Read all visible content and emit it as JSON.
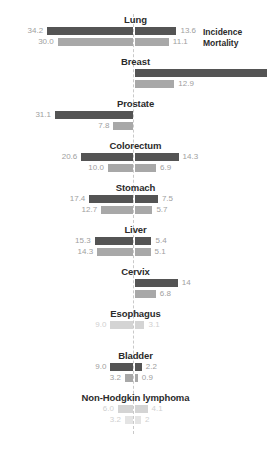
{
  "legend": {
    "incidence_label": "Incidence",
    "mortality_label": "Mortality",
    "incidence_color": "#545454",
    "mortality_color": "#a8a8a8"
  },
  "axis": {
    "center_x": 133,
    "style": "dashed",
    "color": "#c9c9c9"
  },
  "chart_data": {
    "type": "bar",
    "subtype": "diverging-bidirectional-bar",
    "title": "",
    "xlabel": "",
    "ylabel": "",
    "grid": false,
    "legend_position": "top-right",
    "series": [
      {
        "name": "Incidence",
        "color": "#545454"
      },
      {
        "name": "Mortality",
        "color": "#a8a8a8"
      }
    ],
    "categories": [
      "Lung",
      "Breast",
      "Prostate",
      "Colorectum",
      "Stomach",
      "Liver",
      "Cervix",
      "Esophagus",
      "Bladder",
      "Non-Hodgkin lymphoma"
    ],
    "groups": [
      {
        "label": "Lung",
        "incidence_left": 34.2,
        "incidence_right": 13.6,
        "mortality_left": 30.0,
        "mortality_right": 11.1
      },
      {
        "label": "Breast",
        "incidence_left": null,
        "incidence_right": 43.3,
        "mortality_left": null,
        "mortality_right": 12.9
      },
      {
        "label": "Prostate",
        "incidence_left": 31.1,
        "incidence_right": null,
        "mortality_left": 7.8,
        "mortality_right": null
      },
      {
        "label": "Colorectum",
        "incidence_left": 20.6,
        "incidence_right": 14.3,
        "mortality_left": 10.0,
        "mortality_right": 6.9
      },
      {
        "label": "Stomach",
        "incidence_left": 17.4,
        "incidence_right": 7.5,
        "mortality_left": 12.7,
        "mortality_right": 5.7
      },
      {
        "label": "Liver",
        "incidence_left": 15.3,
        "incidence_right": 5.4,
        "mortality_left": 14.3,
        "mortality_right": 5.1
      },
      {
        "label": "Cervix",
        "incidence_left": null,
        "incidence_right": 14,
        "mortality_left": null,
        "mortality_right": 6.8
      },
      {
        "label": "Esophagus",
        "incidence_left": 9.0,
        "incidence_right": 3.1,
        "mortality_left": null,
        "mortality_right": null
      },
      {
        "label": "Bladder",
        "incidence_left": 9.0,
        "incidence_right": 2.2,
        "mortality_left": 3.2,
        "mortality_right": 0.9
      },
      {
        "label": "Non-Hodgkin lymphoma",
        "incidence_left": 6.0,
        "incidence_right": 4.1,
        "mortality_left": 3.2,
        "mortality_right": 2
      }
    ]
  },
  "labels": {
    "lung": {
      "inc_left": "34.2",
      "inc_right": "13.6",
      "mor_left": "30.0",
      "mor_right": "11.1"
    },
    "breast": {
      "inc_left": "",
      "inc_right": "43.3",
      "mor_left": "",
      "mor_right": "12.9"
    },
    "prostate": {
      "inc_left": "31.1",
      "inc_right": "",
      "mor_left": "7.8",
      "mor_right": ""
    },
    "colorectum": {
      "inc_left": "20.6",
      "inc_right": "14.3",
      "mor_left": "10.0",
      "mor_right": "6.9"
    },
    "stomach": {
      "inc_left": "17.4",
      "inc_right": "7.5",
      "mor_left": "12.7",
      "mor_right": "5.7"
    },
    "liver": {
      "inc_left": "15.3",
      "inc_right": "5.4",
      "mor_left": "14.3",
      "mor_right": "5.1"
    },
    "cervix": {
      "inc_left": "",
      "inc_right": "14",
      "mor_left": "",
      "mor_right": "6.8"
    },
    "esophagus": {
      "inc_left": "9.0",
      "inc_right": "3.1",
      "mor_left": "",
      "mor_right": ""
    },
    "bladder": {
      "inc_left": "9.0",
      "inc_right": "2.2",
      "mor_left": "3.2",
      "mor_right": "0.9"
    },
    "nhl": {
      "inc_left": "6.0",
      "inc_right": "4.1",
      "mor_left": "3.2",
      "mor_right": "2"
    }
  },
  "titles": {
    "lung": "Lung",
    "breast": "Breast",
    "prostate": "Prostate",
    "colorectum": "Colorectum",
    "stomach": "Stomach",
    "liver": "Liver",
    "cervix": "Cervix",
    "esophagus": "Esophagus",
    "bladder": "Bladder",
    "nhl": "Non-Hodgkin lymphoma"
  }
}
